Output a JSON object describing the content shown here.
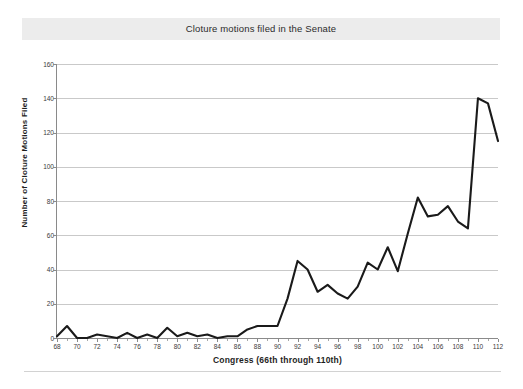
{
  "figure": {
    "title": "Cloture motions filed in the Senate",
    "title_band_color": "#ececec",
    "background": "#ffffff",
    "line_color": "#1a1a1a",
    "grid_color": "#c9c9c9",
    "axis_color": "#8a8a8a"
  },
  "chart_data": {
    "type": "line",
    "title": "Cloture motions filed in the Senate",
    "xlabel": "Congress (66th through 110th)",
    "ylabel": "Number of Cloture Motions Filed",
    "xlim": [
      68,
      112
    ],
    "ylim": [
      0,
      160
    ],
    "ytick_step": 20,
    "xtick_step": 2,
    "grid": true,
    "legend": "none",
    "yticks": [
      0,
      20,
      40,
      60,
      80,
      100,
      120,
      140,
      160
    ],
    "xticks": [
      68,
      70,
      72,
      74,
      76,
      78,
      80,
      82,
      84,
      86,
      88,
      90,
      92,
      94,
      96,
      98,
      100,
      102,
      104,
      106,
      108,
      110,
      112
    ],
    "x": [
      68,
      69,
      70,
      71,
      72,
      73,
      74,
      75,
      76,
      77,
      78,
      79,
      80,
      81,
      82,
      83,
      84,
      85,
      86,
      87,
      88,
      89,
      90,
      91,
      92,
      93,
      94,
      95,
      96,
      97,
      98,
      99,
      100,
      101,
      102,
      103,
      104,
      105,
      106,
      107,
      108,
      109,
      110,
      111,
      112
    ],
    "values": [
      1,
      7,
      0,
      0,
      2,
      1,
      0,
      3,
      0,
      2,
      0,
      6,
      1,
      3,
      1,
      2,
      0,
      1,
      1,
      5,
      7,
      7,
      7,
      23,
      45,
      40,
      27,
      31,
      26,
      23,
      30,
      44,
      40,
      53,
      39,
      61,
      82,
      71,
      72,
      77,
      68,
      64,
      140,
      137,
      115
    ],
    "series": [
      {
        "name": "Cloture motions filed",
        "values": [
          1,
          7,
          0,
          0,
          2,
          1,
          0,
          3,
          0,
          2,
          0,
          6,
          1,
          3,
          1,
          2,
          0,
          1,
          1,
          5,
          7,
          7,
          7,
          23,
          45,
          40,
          27,
          31,
          26,
          23,
          30,
          44,
          40,
          53,
          39,
          61,
          82,
          71,
          72,
          77,
          68,
          64,
          140,
          137,
          115
        ]
      }
    ]
  }
}
